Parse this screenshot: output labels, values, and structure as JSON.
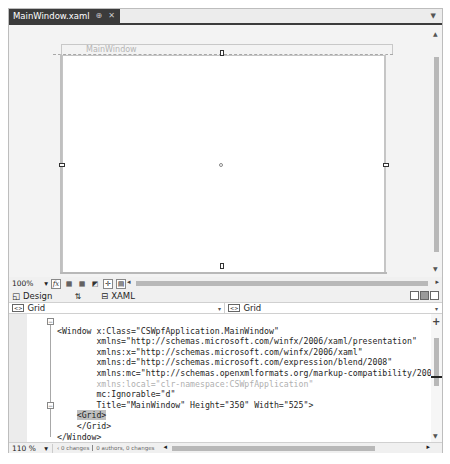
{
  "tab": {
    "title": "MainWindow.xaml",
    "pin": "⊕",
    "close": "✕"
  },
  "designer": {
    "window_title": "MainWindow",
    "zoom": "100%",
    "toolbar_icons": [
      "fx-icon",
      "grid-icon",
      "snap-grid-icon",
      "artboard-bg-icon",
      "snap-lines-icon",
      "effects-icon"
    ]
  },
  "split": {
    "design_label": "Design",
    "swap_icon": "⇅",
    "xaml_label": "XAML"
  },
  "nav": {
    "left_value": "Grid",
    "right_value": "Grid"
  },
  "code_lines": [
    {
      "indent": "",
      "text": "<Window x:Class=\"CSWpfApplication.MainWindow\""
    },
    {
      "indent": "        ",
      "text": "xmlns=\"http://schemas.microsoft.com/winfx/2006/xaml/presentation\""
    },
    {
      "indent": "        ",
      "text": "xmlns:x=\"http://schemas.microsoft.com/winfx/2006/xaml\""
    },
    {
      "indent": "        ",
      "text": "xmlns:d=\"http://schemas.microsoft.com/expression/blend/2008\""
    },
    {
      "indent": "        ",
      "text": "xmlns:mc=\"http://schemas.openxmlformats.org/markup-compatibility/2006\""
    },
    {
      "indent": "        ",
      "text": "xmlns:local=\"clr-namespace:CSWpfApplication\""
    },
    {
      "indent": "        ",
      "text": "mc:Ignorable=\"d\""
    },
    {
      "indent": "        ",
      "text": "Title=\"MainWindow\" Height=\"350\" Width=\"525\">"
    },
    {
      "indent": "    ",
      "text": "<Grid>"
    },
    {
      "indent": "    ",
      "text": "</Grid>"
    },
    {
      "indent": "",
      "text": "</Window>"
    }
  ],
  "status": {
    "zoom": "110 %",
    "changes": "0 changes",
    "authors": "0 authors, 0 changes"
  }
}
